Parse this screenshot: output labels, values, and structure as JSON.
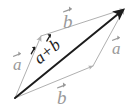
{
  "figure": {
    "kind": "vector-parallelogram-diagram",
    "width": 138,
    "height": 112,
    "background": "#ffffff"
  },
  "colors": {
    "parallelogram_edge": "#b0b0b0",
    "label_gray": "#9a9a9a",
    "resultant": "#1c1c1c",
    "resultant_label": "#1c1c1c",
    "background": "#ffffff"
  },
  "labels": {
    "a_left": "a",
    "a_right": "a",
    "b_top": "b",
    "b_bottom": "b",
    "sum_first": "a",
    "sum_operator": "+",
    "sum_second": "b"
  },
  "geometry": {
    "origin": {
      "x": 15,
      "y": 98
    },
    "left_vertex": {
      "x": 41,
      "y": 36
    },
    "right_vertex": {
      "x": 93,
      "y": 66
    },
    "tip": {
      "x": 124,
      "y": 9
    }
  },
  "vectors": [
    {
      "name": "a-left-edge",
      "from": "origin",
      "to": "left_vertex",
      "label": "a",
      "style": "thin-gray"
    },
    {
      "name": "b-top-edge",
      "from": "left_vertex",
      "to": "tip",
      "label": "b",
      "style": "thin-gray"
    },
    {
      "name": "b-bottom-edge",
      "from": "origin",
      "to": "right_vertex",
      "label": "b",
      "style": "thin-gray"
    },
    {
      "name": "a-right-edge",
      "from": "right_vertex",
      "to": "tip",
      "label": "a",
      "style": "thin-gray"
    },
    {
      "name": "resultant-diagonal",
      "from": "origin",
      "to": "tip",
      "label": "a + b",
      "style": "bold-dark"
    }
  ]
}
